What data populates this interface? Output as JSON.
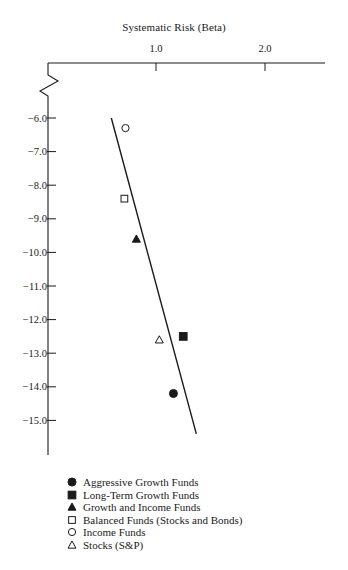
{
  "chart_data": {
    "type": "scatter",
    "title": "Systematic Risk (Beta)",
    "xlabel": "Systematic Risk (Beta)",
    "ylabel": "",
    "x_axis_position": "top",
    "x_ticks": [
      1.0,
      2.0
    ],
    "x_tick_labels": [
      "1.0",
      "2.0"
    ],
    "y_ticks": [
      -6.0,
      -7.0,
      -8.0,
      -9.0,
      -10.0,
      -11.0,
      -12.0,
      -13.0,
      -14.0,
      -15.0
    ],
    "y_tick_labels": [
      "-6.0",
      "-7.0",
      "-8.0",
      "-9.0",
      "-10.0",
      "-11.0",
      "-12.0",
      "-13.0",
      "-14.0",
      "-15.0"
    ],
    "xlim": [
      0,
      2.5
    ],
    "ylim": [
      -16.0,
      -4.7
    ],
    "axis_break": true,
    "grid": false,
    "legend_position": "bottom",
    "series": [
      {
        "name": "Aggressive Growth Funds",
        "marker": "filled-circle",
        "x": [
          1.16
        ],
        "y": [
          -14.2
        ]
      },
      {
        "name": "Long-Term Growth Funds",
        "marker": "filled-square",
        "x": [
          1.25
        ],
        "y": [
          -12.5
        ]
      },
      {
        "name": "Growth and Income Funds",
        "marker": "filled-triangle",
        "x": [
          0.82
        ],
        "y": [
          -9.6
        ]
      },
      {
        "name": "Balanced Funds (Stocks and Bonds)",
        "marker": "open-square",
        "x": [
          0.71
        ],
        "y": [
          -8.4
        ]
      },
      {
        "name": "Income Funds",
        "marker": "open-circle",
        "x": [
          0.72
        ],
        "y": [
          -6.3
        ]
      },
      {
        "name": "Stocks (S&P)",
        "marker": "open-triangle",
        "x": [
          1.03
        ],
        "y": [
          -12.6
        ]
      }
    ],
    "fit_line": {
      "x": [
        0.59,
        1.37
      ],
      "y": [
        -6.0,
        -15.4
      ]
    }
  },
  "legend": {
    "items": [
      {
        "label": "Aggressive Growth Funds",
        "marker": "filled-circle"
      },
      {
        "label": "Long-Term Growth Funds",
        "marker": "filled-square"
      },
      {
        "label": "Growth and Income Funds",
        "marker": "filled-triangle"
      },
      {
        "label": "Balanced Funds (Stocks and Bonds)",
        "marker": "open-square"
      },
      {
        "label": "Income Funds",
        "marker": "open-circle"
      },
      {
        "label": "Stocks (S&P)",
        "marker": "open-triangle"
      }
    ]
  },
  "colors": {
    "ink": "#1a1a1a",
    "background": "#ffffff"
  }
}
